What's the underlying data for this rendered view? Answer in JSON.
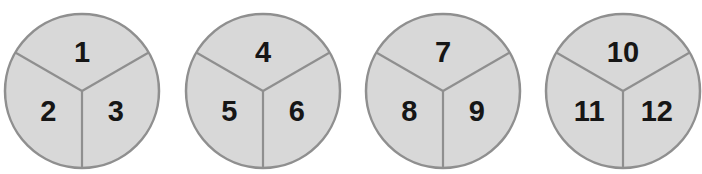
{
  "figure_type": "circles-divided-into-thirds",
  "sector_count_per_circle": 3,
  "colors": {
    "background": "#ffffff",
    "circle_fill": "#d8d8d8",
    "outline": "#8f8f8f",
    "divider": "#8f8f8f",
    "number": "#161616"
  },
  "circles": [
    {
      "sectors": [
        "1",
        "2",
        "3"
      ]
    },
    {
      "sectors": [
        "4",
        "5",
        "6"
      ]
    },
    {
      "sectors": [
        "7",
        "8",
        "9"
      ]
    },
    {
      "sectors": [
        "10",
        "11",
        "12"
      ]
    }
  ]
}
